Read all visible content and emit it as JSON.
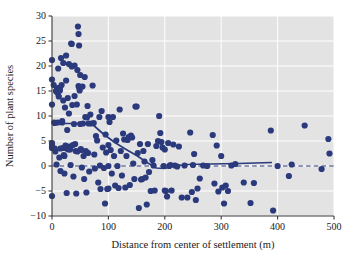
{
  "chart_data": {
    "type": "scatter",
    "title": "",
    "xlabel": "Distance from center of settlement (m)",
    "ylabel": "Number of plant species",
    "xlim": [
      0,
      500
    ],
    "ylim": [
      -10,
      30
    ],
    "xticks": [
      0,
      100,
      200,
      300,
      400,
      500
    ],
    "yticks": [
      -10,
      -5,
      0,
      5,
      10,
      15,
      20,
      25,
      30
    ],
    "xtick_labels": [
      "0",
      "100",
      "200",
      "300",
      "400",
      "500"
    ],
    "ytick_labels": [
      "−10",
      "−5",
      "0",
      "5",
      "10",
      "15",
      "20",
      "25",
      "30"
    ],
    "grid": true,
    "grid_color": "#ffffff",
    "plot_background": "#e3e3e3",
    "point_color": "#2b3a7c",
    "point_size": 3.1,
    "legend": null,
    "annotations": [],
    "series": [
      {
        "name": "plots",
        "marker": "filled-circle",
        "color": "#2b3a7c",
        "points": [
          [
            0,
            21.2
          ],
          [
            0,
            17.3
          ],
          [
            0,
            12.3
          ],
          [
            0,
            4.6
          ],
          [
            0,
            4.4
          ],
          [
            0,
            3.9
          ],
          [
            0,
            3.6
          ],
          [
            0,
            -6.0
          ],
          [
            3,
            16.2
          ],
          [
            4,
            8.7
          ],
          [
            5,
            8.6
          ],
          [
            5,
            3.5
          ],
          [
            6,
            2.9
          ],
          [
            7,
            15.0
          ],
          [
            8,
            14.9
          ],
          [
            8,
            0.3
          ],
          [
            9,
            15.4
          ],
          [
            10,
            15.6
          ],
          [
            10,
            14.6
          ],
          [
            10,
            8.7
          ],
          [
            11,
            19.5
          ],
          [
            12,
            15.2
          ],
          [
            12,
            13.9
          ],
          [
            13,
            1.7
          ],
          [
            14,
            15.6
          ],
          [
            14,
            15.1
          ],
          [
            15,
            3.5
          ],
          [
            15,
            -1.0
          ],
          [
            16,
            21.6
          ],
          [
            17,
            16.2
          ],
          [
            18,
            9.0
          ],
          [
            18,
            8.7
          ],
          [
            19,
            3.6
          ],
          [
            20,
            20.6
          ],
          [
            20,
            13.1
          ],
          [
            21,
            2.2
          ],
          [
            22,
            2.0
          ],
          [
            22,
            -1.5
          ],
          [
            23,
            11.7
          ],
          [
            24,
            4.1
          ],
          [
            25,
            22.1
          ],
          [
            25,
            17.1
          ],
          [
            26,
            3.5
          ],
          [
            26,
            -5.4
          ],
          [
            27,
            7.2
          ],
          [
            28,
            13.6
          ],
          [
            29,
            3.3
          ],
          [
            30,
            20.4
          ],
          [
            30,
            10.5
          ],
          [
            31,
            3.9
          ],
          [
            32,
            3.3
          ],
          [
            33,
            0.2
          ],
          [
            34,
            24.5
          ],
          [
            35,
            24.4
          ],
          [
            35,
            19.9
          ],
          [
            36,
            12.2
          ],
          [
            37,
            4.2
          ],
          [
            38,
            -2.1
          ],
          [
            39,
            8.4
          ],
          [
            40,
            20.1
          ],
          [
            40,
            14.0
          ],
          [
            41,
            4.4
          ],
          [
            42,
            3.0
          ],
          [
            43,
            -5.5
          ],
          [
            44,
            12.3
          ],
          [
            45,
            19.2
          ],
          [
            45,
            2.9
          ],
          [
            46,
            27.9
          ],
          [
            47,
            26.4
          ],
          [
            47,
            16.0
          ],
          [
            48,
            15.7
          ],
          [
            48,
            24.1
          ],
          [
            49,
            15.1
          ],
          [
            50,
            18.2
          ],
          [
            50,
            8.4
          ],
          [
            51,
            3.4
          ],
          [
            52,
            3.2
          ],
          [
            53,
            -0.3
          ],
          [
            54,
            15.9
          ],
          [
            55,
            8.5
          ],
          [
            56,
            2.0
          ],
          [
            57,
            -2.6
          ],
          [
            58,
            17.8
          ],
          [
            59,
            9.8
          ],
          [
            60,
            3.0
          ],
          [
            61,
            -5.3
          ],
          [
            62,
            9.7
          ],
          [
            63,
            12.0
          ],
          [
            64,
            2.6
          ],
          [
            65,
            8.5
          ],
          [
            66,
            -1.1
          ],
          [
            68,
            10.3
          ],
          [
            70,
            8.5
          ],
          [
            72,
            16.1
          ],
          [
            74,
            8.6
          ],
          [
            75,
            2.3
          ],
          [
            76,
            -0.5
          ],
          [
            78,
            6.0
          ],
          [
            80,
            5.1
          ],
          [
            82,
            -3.3
          ],
          [
            84,
            9.8
          ],
          [
            85,
            0.1
          ],
          [
            86,
            -4.6
          ],
          [
            88,
            11.0
          ],
          [
            90,
            3.7
          ],
          [
            92,
            -0.4
          ],
          [
            94,
            -7.5
          ],
          [
            95,
            6.3
          ],
          [
            96,
            2.7
          ],
          [
            98,
            -4.6
          ],
          [
            100,
            9.8
          ],
          [
            100,
            4.2
          ],
          [
            100,
            0.0
          ],
          [
            100,
            -4.5
          ],
          [
            102,
            8.8
          ],
          [
            104,
            3.2
          ],
          [
            106,
            -1.5
          ],
          [
            108,
            9.8
          ],
          [
            110,
            2.0
          ],
          [
            112,
            -3.9
          ],
          [
            114,
            5.1
          ],
          [
            116,
            0.0
          ],
          [
            118,
            -4.4
          ],
          [
            120,
            11.3
          ],
          [
            122,
            3.0
          ],
          [
            124,
            -1.9
          ],
          [
            126,
            6.5
          ],
          [
            128,
            5.3
          ],
          [
            130,
            -4.3
          ],
          [
            132,
            2.0
          ],
          [
            134,
            5.2
          ],
          [
            136,
            5.8
          ],
          [
            138,
            -3.8
          ],
          [
            140,
            6.1
          ],
          [
            142,
            5.7
          ],
          [
            144,
            0.5
          ],
          [
            146,
            -2.6
          ],
          [
            148,
            11.9
          ],
          [
            150,
            11.9
          ],
          [
            152,
            2.6
          ],
          [
            154,
            -8.4
          ],
          [
            156,
            4.4
          ],
          [
            158,
            -2.7
          ],
          [
            160,
            -2.6
          ],
          [
            162,
            3.0
          ],
          [
            164,
            0.9
          ],
          [
            166,
            -2.3
          ],
          [
            168,
            -7.7
          ],
          [
            170,
            4.4
          ],
          [
            172,
            -1.2
          ],
          [
            175,
            -5.0
          ],
          [
            178,
            1.2
          ],
          [
            180,
            0.1
          ],
          [
            182,
            -4.9
          ],
          [
            185,
            4.0
          ],
          [
            188,
            5.0
          ],
          [
            190,
            10.0
          ],
          [
            192,
            6.6
          ],
          [
            194,
            4.8
          ],
          [
            196,
            3.7
          ],
          [
            198,
            0.0
          ],
          [
            200,
            3.3
          ],
          [
            200,
            -4.9
          ],
          [
            202,
            -5.0
          ],
          [
            204,
            -6.1
          ],
          [
            206,
            4.6
          ],
          [
            208,
            0.0
          ],
          [
            210,
            0.2
          ],
          [
            212,
            -4.9
          ],
          [
            215,
            4.3
          ],
          [
            218,
            0.1
          ],
          [
            222,
            -0.1
          ],
          [
            225,
            3.9
          ],
          [
            230,
            -6.3
          ],
          [
            235,
            0.1
          ],
          [
            240,
            -6.3
          ],
          [
            245,
            6.7
          ],
          [
            248,
            -5.2
          ],
          [
            250,
            0.2
          ],
          [
            252,
            2.4
          ],
          [
            255,
            -6.8
          ],
          [
            258,
            -4.5
          ],
          [
            262,
            -2.5
          ],
          [
            268,
            0.1
          ],
          [
            275,
            0.0
          ],
          [
            285,
            6.2
          ],
          [
            288,
            -3.5
          ],
          [
            292,
            4.1
          ],
          [
            295,
            -5.1
          ],
          [
            300,
            2.0
          ],
          [
            302,
            -4.3
          ],
          [
            305,
            -7.5
          ],
          [
            308,
            -3.9
          ],
          [
            312,
            -5.0
          ],
          [
            318,
            0.1
          ],
          [
            325,
            0.4
          ],
          [
            340,
            -3.3
          ],
          [
            352,
            -7.4
          ],
          [
            358,
            -3.4
          ],
          [
            388,
            7.1
          ],
          [
            392,
            -8.9
          ],
          [
            400,
            0.0
          ],
          [
            420,
            -2.0
          ],
          [
            425,
            0.3
          ],
          [
            448,
            8.1
          ],
          [
            490,
            5.4
          ],
          [
            492,
            2.5
          ],
          [
            478,
            -0.6
          ]
        ]
      }
    ],
    "fit_line": {
      "name": "smoothed trend",
      "style": "solid",
      "color": "#2b3a7c",
      "points": [
        [
          0,
          8.5
        ],
        [
          40,
          8.5
        ],
        [
          70,
          8.5
        ],
        [
          90,
          6.5
        ],
        [
          110,
          4.8
        ],
        [
          130,
          3.4
        ],
        [
          150,
          2.1
        ],
        [
          170,
          0.6
        ],
        [
          185,
          -0.4
        ],
        [
          200,
          -0.5
        ],
        [
          215,
          0.0
        ],
        [
          240,
          0.3
        ],
        [
          280,
          0.4
        ],
        [
          330,
          0.5
        ],
        [
          390,
          0.7
        ]
      ]
    },
    "reference_line": {
      "name": "zero-line",
      "style": "dashed",
      "color": "#2b3a7c",
      "y": 0,
      "x_range": [
        0,
        500
      ]
    }
  }
}
